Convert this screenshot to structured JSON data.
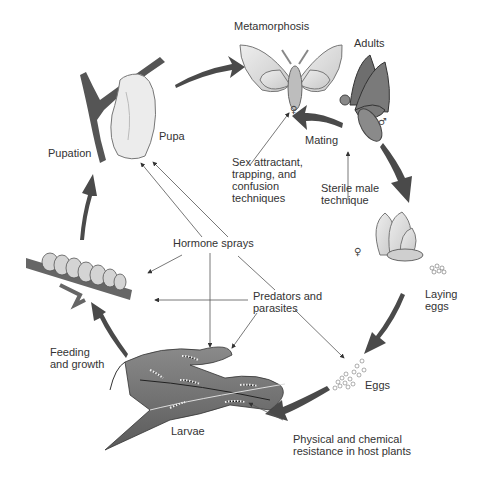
{
  "diagram": {
    "type": "life-cycle",
    "stages": [
      {
        "id": "metamorphosis",
        "label": "Metamorphosis"
      },
      {
        "id": "adults",
        "label": "Adults"
      },
      {
        "id": "mating",
        "label": "Mating"
      },
      {
        "id": "laying-eggs",
        "label": "Laying\neggs"
      },
      {
        "id": "eggs",
        "label": "Eggs"
      },
      {
        "id": "larvae",
        "label": "Larvae"
      },
      {
        "id": "feeding",
        "label": "Feeding\nand growth"
      },
      {
        "id": "pupation",
        "label": "Pupation"
      },
      {
        "id": "pupa",
        "label": "Pupa"
      }
    ],
    "controls": [
      {
        "id": "sex-attractant",
        "label": "Sex attractant,\ntrapping, and\nconfusion\ntechniques"
      },
      {
        "id": "sterile-male",
        "label": "Sterile male\ntechnique"
      },
      {
        "id": "hormone-sprays",
        "label": "Hormone sprays"
      },
      {
        "id": "predators",
        "label": "Predators and\nparasites"
      },
      {
        "id": "host-resistance",
        "label": "Physical and chemical\nresistance in host plants"
      }
    ],
    "symbols": {
      "female": "♀",
      "male": "♂"
    },
    "colors": {
      "arrow": "#4a4a4a",
      "line": "#555555",
      "text": "#333333",
      "leaf": "#6b6b6b",
      "wing_light": "#d8d8d8",
      "wing_dark": "#6e6e6e"
    }
  }
}
